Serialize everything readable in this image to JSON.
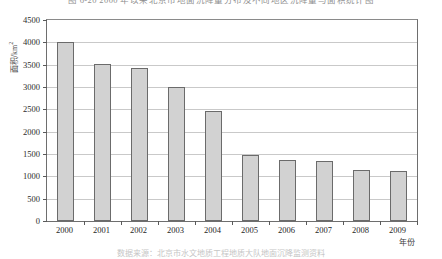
{
  "figure": {
    "top_caption": "图 6-20   2000 年以来北京市地面沉降量分布及不同地区沉降量与面积统计图",
    "bottom_caption": "数据来源：北京市水文地质工程地质大队地面沉降监测资料"
  },
  "axes": {
    "y_title": "面积/km",
    "y_title_sup": "2",
    "x_title": "年份",
    "y_ticks": [
      "0",
      "500",
      "1000",
      "1500",
      "2000",
      "2500",
      "3000",
      "3500",
      "4000",
      "4500"
    ]
  },
  "chart_data": {
    "type": "bar",
    "title": "图 6-20   2000 年以来北京市地面沉降量分布及不同地区沉降量与面积统计图",
    "xlabel": "年份",
    "ylabel": "面积/km²",
    "categories": [
      "2000",
      "2001",
      "2002",
      "2003",
      "2004",
      "2005",
      "2006",
      "2007",
      "2008",
      "2009"
    ],
    "values": [
      4010,
      3520,
      3420,
      3000,
      2460,
      1470,
      1370,
      1350,
      1150,
      1110
    ],
    "ylim": [
      0,
      4500
    ],
    "ytick_step": 500,
    "grid": true,
    "legend": false,
    "bar_fill": "#d2d2d2",
    "bar_border": "#6b6b6b"
  }
}
